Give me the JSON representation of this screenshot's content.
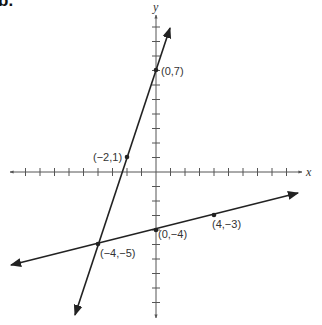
{
  "problem": {
    "label": "b."
  },
  "graph": {
    "origin_px": [
      156,
      172
    ],
    "unit_px": 14.5,
    "x_axis_label": "x",
    "y_axis_label": "y",
    "x_ticks": [
      -10,
      -9,
      -8,
      -7,
      -6,
      -5,
      -4,
      -3,
      -2,
      -1,
      1,
      2,
      3,
      4,
      5,
      6,
      7,
      8,
      9
    ],
    "y_ticks": [
      -10,
      -9,
      -8,
      -7,
      -6,
      -5,
      -4,
      -3,
      -2,
      -1,
      1,
      2,
      3,
      4,
      5,
      6,
      7,
      8,
      9,
      10
    ],
    "lines": [
      {
        "name": "steep-line",
        "through": [
          [
            -4,
            -5
          ],
          [
            -2,
            1
          ],
          [
            0,
            7
          ]
        ],
        "slope": 3,
        "intercept": 7
      },
      {
        "name": "shallow-line",
        "through": [
          [
            -4,
            -5
          ],
          [
            0,
            -4
          ],
          [
            4,
            -3
          ]
        ],
        "slope": 0.25,
        "intercept": -4
      }
    ],
    "points": [
      {
        "label": "(0,7)",
        "x": 0,
        "y": 7
      },
      {
        "label": "(−2,1)",
        "x": -2,
        "y": 1
      },
      {
        "label": "(0,−4)",
        "x": 0,
        "y": -4
      },
      {
        "label": "(4,−3)",
        "x": 4,
        "y": -3
      },
      {
        "label": "(−4,−5)",
        "x": -4,
        "y": -5
      }
    ],
    "colors": {
      "line": "#222222",
      "axis": "#555555",
      "text": "#333333"
    }
  }
}
